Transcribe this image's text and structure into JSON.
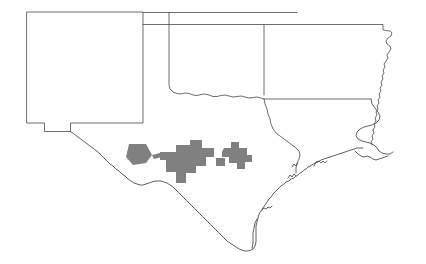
{
  "map": {
    "title": "Southwestern United States outline map with shaded county cluster",
    "background_color": "#ffffff",
    "outline_color": "#4a4a4a",
    "highlight_color": "#808080",
    "width": 426,
    "height": 264,
    "states": [
      {
        "name": "New Mexico",
        "id": "new-mexico",
        "label": "",
        "path": "M 27 12 L 143 12 L 143 123 L 70 123 L 70 131 L 45 131 L 45 123 L 27 123 Z"
      },
      {
        "name": "Texas Panhandle and body",
        "id": "texas",
        "label": "",
        "path": "M 143 12 L 143 123 L 70 123 L 70 131 L 73 133 L 80 138 L 88 143 L 96 150 L 104 157 L 112 163 L 118 168 L 124 172 L 130 177 L 136 181 L 142 184 L 148 185 L 154 184 L 160 183 L 166 182 L 172 182 L 178 184 L 184 188 L 190 193 L 196 198 L 202 203 L 208 208 L 214 213 L 220 218 L 226 223 L 232 228 L 238 233 L 243 238 L 247 243 L 249 248 L 250 252"
      },
      {
        "name": "Oklahoma",
        "id": "oklahoma",
        "label": "",
        "path": "M 143 24 L 265 24 L 265 95 L 263 98 L 258 99 L 250 100 L 242 99 L 234 98 L 226 99 L 218 99 L 210 97 L 202 96 L 195 97 L 188 97 L 182 96 L 176 95 L 172 92 L 170 88 L 169 80 L 169 24"
      },
      {
        "name": "Arkansas",
        "id": "arkansas",
        "label": "",
        "path": "M 265 24 L 384 24 L 384 32 L 390 32 L 390 38 L 386 40 L 385 44 L 388 46 L 390 50 L 389 55 L 387 58 L 388 62 L 386 66 L 387 70 L 385 74 L 386 78 L 384 82 L 385 86 L 383 90 L 384 94 L 382 98 L 383 102 L 381 106 L 382 110 L 380 114 L 381 118 L 379 122 L 380 126 L 378 130"
      },
      {
        "name": "Louisiana",
        "id": "louisiana",
        "label": "",
        "path": "M 265 95 L 265 100 L 268 104 L 272 108 L 276 112 L 280 116 L 284 120 L 288 123 L 292 126"
      },
      {
        "name": "Mississippi western boundary",
        "id": "mississippi",
        "label": "",
        "path": "M 378 130 L 380 134 L 378 138 L 379 142 L 377 146 L 378 150"
      }
    ],
    "highlight": {
      "name": "shaded county cluster",
      "description": "Gray shaded counties in west and south-central Texas along the Rio Grande",
      "color": "#808080"
    },
    "features": [
      {
        "name": "rio-grande-border",
        "id": "rio-grande"
      },
      {
        "name": "gulf-coast",
        "id": "gulf-coast"
      },
      {
        "name": "mississippi-river",
        "id": "mississippi-river"
      },
      {
        "name": "new-mexico-bootheel",
        "id": "bootheel"
      },
      {
        "name": "oklahoma-panhandle",
        "id": "ok-panhandle"
      },
      {
        "name": "missouri-bootheel-notch",
        "id": "mo-bootheel"
      }
    ]
  }
}
